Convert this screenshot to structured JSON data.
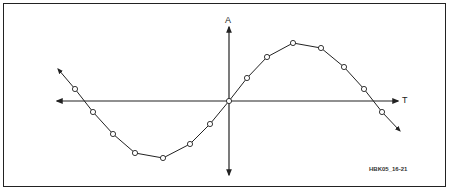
{
  "diagram": {
    "axis_labels": {
      "y": "A",
      "x": "T"
    },
    "figure_id": "HBK05_16-21",
    "colors": {
      "line": "#222222",
      "background": "#ffffff",
      "marker_fill": "#ffffff"
    },
    "curve": "sine wave with sampled points (open circles)",
    "points": [
      [
        75,
        89
      ],
      [
        93,
        112
      ],
      [
        113,
        134
      ],
      [
        135,
        153
      ],
      [
        163,
        158
      ],
      [
        190,
        144
      ],
      [
        210,
        124
      ],
      [
        229,
        101
      ],
      [
        247,
        78
      ],
      [
        267,
        57
      ],
      [
        293,
        43
      ],
      [
        321,
        48
      ],
      [
        344,
        67
      ],
      [
        364,
        89
      ],
      [
        382,
        112
      ]
    ],
    "curve_start_arrow": [
      58,
      69
    ],
    "curve_end_arrow": [
      400,
      131
    ],
    "axes": {
      "origin": [
        229,
        101
      ],
      "x_axis": {
        "from": 57,
        "to": 398
      },
      "y_axis": {
        "from": 27,
        "to": 175
      }
    }
  }
}
